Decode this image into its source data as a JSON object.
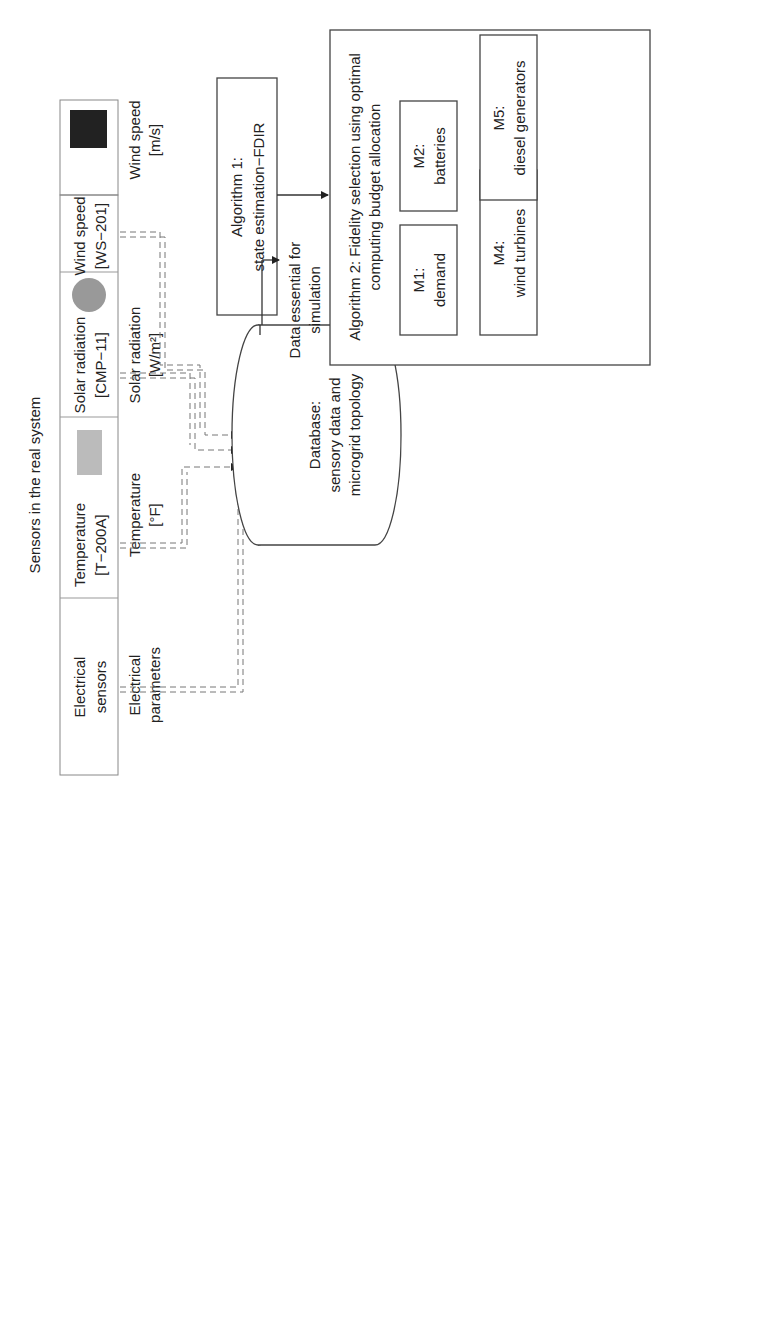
{
  "sensors": {
    "title": "Sensors in the real system",
    "items": [
      {
        "name": "Electrical",
        "model": "sensors",
        "measure": "Electrical",
        "unit": "parameters",
        "icon": "none"
      },
      {
        "name": "Temperature",
        "model": "[T−200A]",
        "measure": "Temperature",
        "unit": "[°F]",
        "icon": "thermometer-sensor-icon"
      },
      {
        "name": "Solar radiation",
        "model": "[CMP−11]",
        "measure": "Solar radiation",
        "unit": "[W/m²]",
        "icon": "pyranometer-icon"
      },
      {
        "name": "Wind speed",
        "model": "[WS−201]",
        "measure": "Wind speed",
        "unit": "[m/s]",
        "icon": "anemometer-icon"
      }
    ]
  },
  "algorithm1": {
    "line1": "Algorithm 1:",
    "line2": "state estimation−FDIR"
  },
  "algorithm2": {
    "line1": "Algorithm 2: Fidelity selection using optimal",
    "line2": "computing budget allocation",
    "modules": [
      {
        "id": "M1:",
        "name": "demand"
      },
      {
        "id": "M2:",
        "name": "batteries"
      },
      {
        "id": "M3:",
        "name": "solar generators"
      },
      {
        "id": "M4:",
        "name": "wind turbines"
      },
      {
        "id": "M5:",
        "name": "diesel generators"
      }
    ]
  },
  "algorithm3": {
    "line1": "Algorithm 3:",
    "line2": "control task−Load dispatch"
  },
  "database": {
    "line1": "Database:",
    "line2": "sensory data and",
    "line3": "microgrid topology"
  },
  "flows": {
    "essential1": "Data essential for",
    "essential2": "simulation",
    "fidelity1": "Fidelity",
    "fidelity2": "level",
    "retrieval1": "Data retrieval with",
    "retrieval2": "assigned fidelity",
    "decision1": "Decision",
    "decision2": "variables",
    "topology1": "Microgrid's",
    "topology2": "topology",
    "provision1": "Power",
    "provision2": "provision",
    "price1": "Power",
    "price2": "price"
  },
  "microgrid": {
    "title": "Microgrid",
    "hv": "20 kV",
    "lv": "400 V",
    "grid": "Grid",
    "residential1": "Residential",
    "residential2": "load",
    "industrial1": "Industrial",
    "industrial2": "load",
    "commercial1": "Commercial",
    "commercial2": "load",
    "mt": "MT",
    "wt": "WT 1",
    "pv25": "PV 2...5",
    "pv1": "PV 1",
    "fc": "FC",
    "nodes": [
      "1",
      "2",
      "3",
      "4",
      "5",
      "6",
      "7",
      "8",
      "9",
      "10",
      "11",
      "12",
      "1413",
      "1615"
    ]
  },
  "legend": {
    "title": "Legend",
    "sensors": ": Data from sensors",
    "modules": ": Data from modules and algorithms",
    "maingrid": ": Data from main grid",
    "module": "M : Module"
  }
}
